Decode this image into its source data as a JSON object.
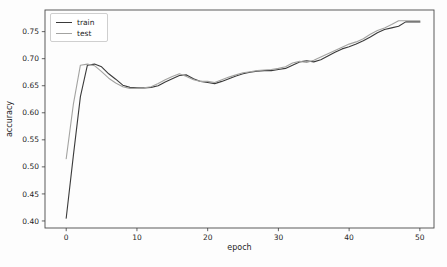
{
  "chart_data": {
    "type": "line",
    "xlabel": "epoch",
    "ylabel": "accuracy",
    "x": [
      0,
      1,
      2,
      3,
      4,
      5,
      6,
      7,
      8,
      9,
      10,
      11,
      12,
      13,
      14,
      15,
      16,
      17,
      18,
      19,
      20,
      21,
      22,
      23,
      24,
      25,
      26,
      27,
      28,
      29,
      30,
      31,
      32,
      33,
      34,
      35,
      36,
      37,
      38,
      39,
      40,
      41,
      42,
      43,
      44,
      45,
      46,
      47,
      48,
      49,
      50
    ],
    "series": [
      {
        "name": "train",
        "color": "#3a3a3a",
        "values": [
          0.405,
          0.52,
          0.63,
          0.688,
          0.69,
          0.685,
          0.672,
          0.662,
          0.651,
          0.647,
          0.646,
          0.646,
          0.647,
          0.65,
          0.657,
          0.663,
          0.669,
          0.67,
          0.663,
          0.658,
          0.656,
          0.654,
          0.658,
          0.663,
          0.668,
          0.672,
          0.675,
          0.677,
          0.678,
          0.678,
          0.68,
          0.682,
          0.688,
          0.694,
          0.696,
          0.694,
          0.698,
          0.705,
          0.712,
          0.718,
          0.722,
          0.727,
          0.733,
          0.74,
          0.748,
          0.754,
          0.757,
          0.76,
          0.768,
          0.768,
          0.768
        ]
      },
      {
        "name": "test",
        "color": "#a3a3a1",
        "values": [
          0.515,
          0.615,
          0.688,
          0.69,
          0.687,
          0.676,
          0.664,
          0.655,
          0.648,
          0.645,
          0.645,
          0.646,
          0.648,
          0.654,
          0.661,
          0.667,
          0.672,
          0.667,
          0.661,
          0.658,
          0.658,
          0.656,
          0.661,
          0.666,
          0.67,
          0.674,
          0.676,
          0.678,
          0.679,
          0.68,
          0.682,
          0.685,
          0.692,
          0.695,
          0.693,
          0.697,
          0.703,
          0.709,
          0.715,
          0.721,
          0.727,
          0.731,
          0.737,
          0.745,
          0.752,
          0.757,
          0.763,
          0.77,
          0.77,
          0.77,
          0.77
        ]
      }
    ],
    "xticks": [
      0,
      10,
      20,
      30,
      40,
      50
    ],
    "yticks": [
      0.4,
      0.45,
      0.5,
      0.55,
      0.6,
      0.65,
      0.7,
      0.75
    ],
    "xlim": [
      -3,
      52
    ],
    "ylim": [
      0.387,
      0.79
    ],
    "grid": false,
    "legend_position": "upper-left",
    "colors": {
      "spine": "#4a4a4a",
      "tick": "#3c3c3c",
      "text": "#262626"
    }
  }
}
